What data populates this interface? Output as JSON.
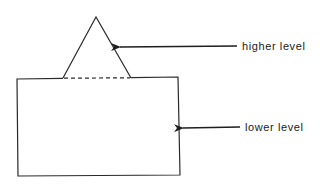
{
  "diagram": {
    "labels": {
      "higher": "higher level",
      "lower": "lower level"
    },
    "colors": {
      "stroke": "#2a2a2a",
      "text": "#1a1a1a",
      "background": "#ffffff"
    },
    "shapes": {
      "triangle": {
        "apex": [
          96,
          17
        ],
        "base_left": [
          63,
          78
        ],
        "base_right": [
          131,
          78
        ],
        "base_style": "dashed"
      },
      "rectangle": {
        "top_left": [
          17,
          79
        ],
        "top_right": [
          178,
          77
        ],
        "bottom_right": [
          180,
          175
        ],
        "bottom_left": [
          18,
          176
        ]
      }
    },
    "arrows": [
      {
        "from": [
          237,
          46
        ],
        "to": [
          118,
          47
        ],
        "points_to": "triangle",
        "label": "higher level"
      },
      {
        "from": [
          240,
          127
        ],
        "to": [
          181,
          128
        ],
        "points_to": "rectangle",
        "label": "lower level"
      }
    ]
  }
}
